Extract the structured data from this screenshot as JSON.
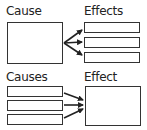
{
  "top": {
    "cause_label": "Cause",
    "effects_label": "Effects",
    "effects_count": 3
  },
  "bottom": {
    "causes_label": "Causes",
    "effect_label": "Effect",
    "causes_count": 3
  },
  "colors": {
    "stroke": "#333333",
    "background": "#ffffff"
  }
}
